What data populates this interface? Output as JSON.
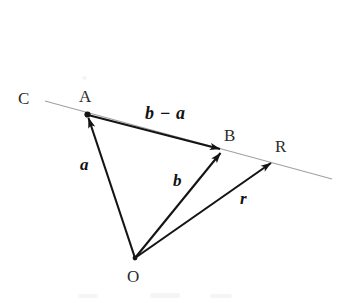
{
  "figure": {
    "background_color": "#ffffff",
    "stroke_color": "#141414",
    "guide_line_color": "#9a9a9a",
    "points": [
      {
        "id": "C",
        "label": "C",
        "label_x": 18,
        "label_y": 90
      },
      {
        "id": "A",
        "label": "A",
        "label_x": 79,
        "label_y": 88,
        "x": 87,
        "y": 114
      },
      {
        "id": "B",
        "label": "B",
        "label_x": 224,
        "label_y": 127,
        "x": 223,
        "y": 150
      },
      {
        "id": "R",
        "label": "R",
        "label_x": 275,
        "label_y": 138,
        "x": 274,
        "y": 161
      },
      {
        "id": "O",
        "label": "O",
        "label_x": 127,
        "label_y": 268,
        "x": 135,
        "y": 258
      }
    ],
    "vectors": [
      {
        "id": "a",
        "label": "a",
        "from": "O",
        "to": "A",
        "label_x": 80,
        "label_y": 156
      },
      {
        "id": "b-minus-a",
        "label": "b − a",
        "from": "A",
        "to": "B",
        "label_x": 145,
        "label_y": 104
      },
      {
        "id": "b",
        "label": "b",
        "from": "O",
        "to": "B",
        "label_x": 173,
        "label_y": 172
      },
      {
        "id": "r",
        "label": "r",
        "from": "O",
        "to": "R",
        "label_x": 240,
        "label_y": 190
      }
    ],
    "guide_line": {
      "id": "line-CR",
      "from_x": 45,
      "from_y": 101,
      "to_x": 332,
      "to_y": 179
    }
  }
}
